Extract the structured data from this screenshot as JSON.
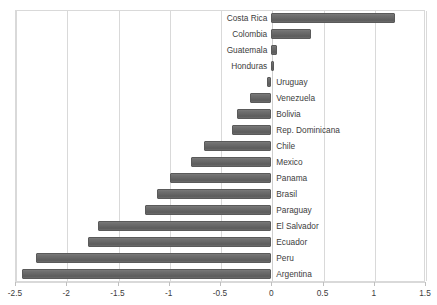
{
  "chart_data": {
    "type": "bar",
    "orientation": "horizontal",
    "title": "",
    "xlabel": "",
    "ylabel": "",
    "xlim": [
      -2.5,
      1.5
    ],
    "xticks": [
      "-2.5",
      "-2",
      "-1.5",
      "-1",
      "-0.5",
      "0",
      "0.5",
      "1",
      "1.5"
    ],
    "xtick_values": [
      -2.5,
      -2,
      -1.5,
      -1,
      -0.5,
      0,
      0.5,
      1,
      1.5
    ],
    "grid": true,
    "legend": "none",
    "bar_color": "#666666",
    "categories": [
      "Costa Rica",
      "Colombia",
      "Guatemala",
      "Honduras",
      "Uruguay",
      "Venezuela",
      "Bolivia",
      "Rep. Dominicana",
      "Chile",
      "Mexico",
      "Panama",
      "Brasil",
      "Paraguay",
      "El Salvador",
      "Ecuador",
      "Peru",
      "Argentina"
    ],
    "values": [
      1.21,
      0.39,
      0.06,
      0.03,
      -0.04,
      -0.21,
      -0.33,
      -0.38,
      -0.66,
      -0.78,
      -0.99,
      -1.11,
      -1.23,
      -1.69,
      -1.79,
      -2.3,
      -2.43
    ]
  }
}
